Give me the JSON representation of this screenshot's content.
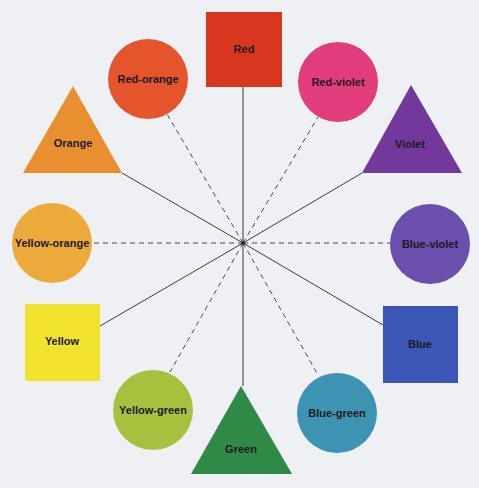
{
  "legend": {
    "square": "Primary colors",
    "triangle": "Secondary colors",
    "circle": "Tertiary colors",
    "solid_line": "Connects primary/secondary colors",
    "dashed_line": "Connects tertiary colors"
  },
  "colors": [
    {
      "name": "Red",
      "shape": "square",
      "hex": "#d8371f"
    },
    {
      "name": "Red-orange",
      "shape": "circle",
      "hex": "#e5552c"
    },
    {
      "name": "Orange",
      "shape": "triangle",
      "hex": "#ea8f2f"
    },
    {
      "name": "Yellow-orange",
      "shape": "circle",
      "hex": "#ebaa3a"
    },
    {
      "name": "Yellow",
      "shape": "square",
      "hex": "#f1e22e"
    },
    {
      "name": "Yellow-green",
      "shape": "circle",
      "hex": "#a6c13e"
    },
    {
      "name": "Green",
      "shape": "triangle",
      "hex": "#2e8a46"
    },
    {
      "name": "Blue-green",
      "shape": "circle",
      "hex": "#3c94b2"
    },
    {
      "name": "Blue",
      "shape": "square",
      "hex": "#3b56b6"
    },
    {
      "name": "Blue-violet",
      "shape": "circle",
      "hex": "#6a4fad"
    },
    {
      "name": "Violet",
      "shape": "triangle",
      "hex": "#73389c"
    },
    {
      "name": "Red-violet",
      "shape": "circle",
      "hex": "#e13d7c"
    }
  ],
  "background": "#eef0f4"
}
